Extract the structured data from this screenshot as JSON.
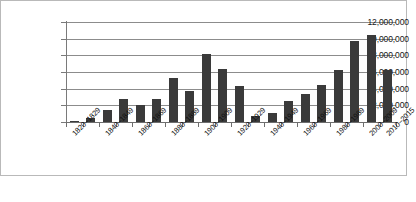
{
  "chart_data": {
    "type": "bar",
    "title": "",
    "subtitle": "",
    "xlabel": "",
    "ylabel": "",
    "ylim": [
      0,
      12000000
    ],
    "ytick_step": 2000000,
    "grid": true,
    "legend": "none",
    "bar_color": "#3a3a3a",
    "categories": [
      "1820–1829",
      "1830–1839",
      "1840–1849",
      "1850–1859",
      "1860–1869",
      "1870–1879",
      "1880–1889",
      "1890–1899",
      "1900–1909",
      "1910–1919",
      "1920–1929",
      "1930–1939",
      "1940–1949",
      "1950–1959",
      "1960–1969",
      "1970–1979",
      "1980–1989",
      "1990–1999",
      "2000–2009",
      "2010–2015"
    ],
    "values": [
      130000,
      540000,
      1430000,
      2810000,
      2080000,
      2740000,
      5250000,
      3690000,
      8200000,
      6350000,
      4300000,
      700000,
      1030000,
      2520000,
      3320000,
      4490000,
      6240000,
      9780000,
      10400000,
      6300000
    ],
    "ytick_labels": [
      "12,000,000",
      "10,000,000",
      "8,000,000",
      "6,000,000",
      "4,000,000",
      "2,000,000",
      "0"
    ],
    "ytick_values": [
      12000000,
      10000000,
      8000000,
      6000000,
      4000000,
      2000000,
      0
    ],
    "visible_xtick_labels": [
      "1820–1829",
      "1840–1849",
      "1860–1869",
      "1880–1889",
      "1900–1909",
      "1920–1929",
      "1940–1949",
      "1960–1969",
      "1980–1989",
      "2000–2009",
      "2010–2015"
    ],
    "visible_xtick_indices": [
      0,
      2,
      4,
      6,
      8,
      10,
      12,
      14,
      16,
      18,
      19
    ]
  }
}
